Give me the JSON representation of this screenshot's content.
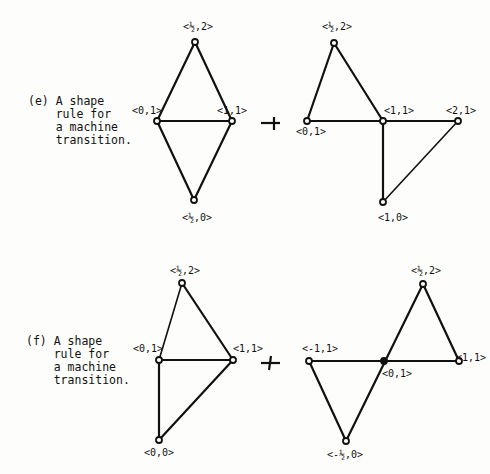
{
  "figures": [
    {
      "id": "e",
      "caption_lines": [
        "(e) A shape",
        "    rule for",
        "    a machine",
        "    transition."
      ],
      "left_shape": {
        "nodes": [
          {
            "label": "<½,2>",
            "coord": [
              0.5,
              2
            ]
          },
          {
            "label": "<0,1>",
            "coord": [
              0,
              1
            ]
          },
          {
            "label": "<1,1>",
            "coord": [
              1,
              1
            ]
          },
          {
            "label": "<½,0>",
            "coord": [
              0.5,
              0
            ]
          }
        ]
      },
      "arrow": "→",
      "right_shape": {
        "nodes": [
          {
            "label": "<½,2>",
            "coord": [
              0.5,
              2
            ]
          },
          {
            "label": "<0,1>",
            "coord": [
              0,
              1
            ]
          },
          {
            "label": "<1,1>",
            "coord": [
              1,
              1
            ]
          },
          {
            "label": "<2,1>",
            "coord": [
              2,
              1
            ]
          },
          {
            "label": "<1,0>",
            "coord": [
              1,
              0
            ]
          }
        ]
      }
    },
    {
      "id": "f",
      "caption_lines": [
        "(f) A shape",
        "    rule for",
        "    a machine",
        "    transition."
      ],
      "left_shape": {
        "nodes": [
          {
            "label": "<½,2>",
            "coord": [
              0.5,
              2
            ]
          },
          {
            "label": "<0,1>",
            "coord": [
              0,
              1
            ]
          },
          {
            "label": "<1,1>",
            "coord": [
              1,
              1
            ]
          },
          {
            "label": "<0,0>",
            "coord": [
              0,
              0
            ]
          }
        ]
      },
      "arrow": "→",
      "right_shape": {
        "nodes": [
          {
            "label": "<½,2>",
            "coord": [
              0.5,
              2
            ]
          },
          {
            "label": "<-1,1>",
            "coord": [
              -1,
              1
            ]
          },
          {
            "label": "<0,1>",
            "coord": [
              0,
              1
            ]
          },
          {
            "label": "<1,1>",
            "coord": [
              1,
              1
            ]
          },
          {
            "label": "<-½,0>",
            "coord": [
              -0.5,
              0
            ]
          }
        ]
      }
    }
  ]
}
